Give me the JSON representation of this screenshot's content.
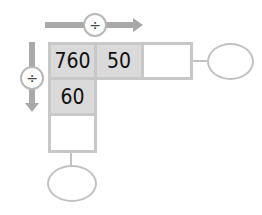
{
  "diagram": {
    "horizontal_operator": "÷",
    "vertical_operator": "÷",
    "row_cells": [
      "760",
      "50",
      ""
    ],
    "column_cells": [
      "60",
      ""
    ],
    "right_oval": "",
    "bottom_oval": "",
    "colors": {
      "arrow": "#a9a9a9",
      "filled_cell": "#dadada",
      "border": "#c8c8c8"
    }
  }
}
